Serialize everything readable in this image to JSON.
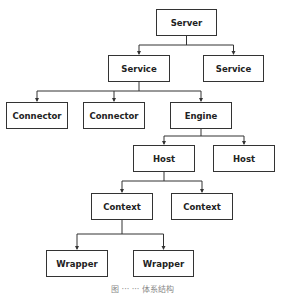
{
  "diagram": {
    "type": "tree",
    "nodes": [
      {
        "id": "server",
        "label": "Server",
        "x": 156,
        "y": 9,
        "w": 61,
        "h": 27
      },
      {
        "id": "service1",
        "label": "Service",
        "x": 108,
        "y": 55,
        "w": 62,
        "h": 27
      },
      {
        "id": "service2",
        "label": "Service",
        "x": 203,
        "y": 55,
        "w": 61,
        "h": 27
      },
      {
        "id": "connector1",
        "label": "Connector",
        "x": 6,
        "y": 102,
        "w": 62,
        "h": 27
      },
      {
        "id": "connector2",
        "label": "Connector",
        "x": 83,
        "y": 102,
        "w": 62,
        "h": 27
      },
      {
        "id": "engine",
        "label": "Engine",
        "x": 170,
        "y": 102,
        "w": 62,
        "h": 27
      },
      {
        "id": "host1",
        "label": "Host",
        "x": 133,
        "y": 145,
        "w": 62,
        "h": 27
      },
      {
        "id": "host2",
        "label": "Host",
        "x": 213,
        "y": 145,
        "w": 62,
        "h": 27
      },
      {
        "id": "context1",
        "label": "Context",
        "x": 91,
        "y": 193,
        "w": 62,
        "h": 27
      },
      {
        "id": "context2",
        "label": "Context",
        "x": 171,
        "y": 193,
        "w": 62,
        "h": 27
      },
      {
        "id": "wrapper1",
        "label": "Wrapper",
        "x": 46,
        "y": 250,
        "w": 62,
        "h": 27
      },
      {
        "id": "wrapper2",
        "label": "Wrapper",
        "x": 133,
        "y": 250,
        "w": 61,
        "h": 27
      }
    ],
    "edges": [
      [
        "server",
        "service1"
      ],
      [
        "server",
        "service2"
      ],
      [
        "service1",
        "connector1"
      ],
      [
        "service1",
        "connector2"
      ],
      [
        "service1",
        "engine"
      ],
      [
        "engine",
        "host1"
      ],
      [
        "engine",
        "host2"
      ],
      [
        "host1",
        "context1"
      ],
      [
        "host1",
        "context2"
      ],
      [
        "context1",
        "wrapper1"
      ],
      [
        "context1",
        "wrapper2"
      ]
    ],
    "caption": "图 ··· ··· 体系结构"
  }
}
